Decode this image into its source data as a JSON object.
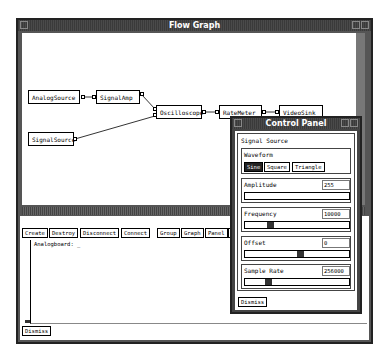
{
  "flow_window": {
    "title": "Flow Graph",
    "nodes": [
      {
        "id": "analog",
        "label": "AnalogSource"
      },
      {
        "id": "amp",
        "label": "SignalAmp"
      },
      {
        "id": "sigsrc",
        "label": "SignalSource"
      },
      {
        "id": "scope",
        "label": "Oscilloscope"
      },
      {
        "id": "rate",
        "label": "RateMeter"
      },
      {
        "id": "video",
        "label": "VideoSink"
      }
    ],
    "toolbar": [
      "Create",
      "Destroy",
      "Disconnect",
      "Connect",
      "Group",
      "Graph",
      "Panel",
      "C"
    ],
    "console_text": "Analogboard: _",
    "dismiss_label": "Dismiss"
  },
  "control_panel": {
    "title": "Control Panel",
    "section": "Signal Source",
    "waveform": {
      "label": "Waveform",
      "options": [
        "Sine",
        "Square",
        "Triangle"
      ],
      "selected": "Sine"
    },
    "params": [
      {
        "label": "Amplitude",
        "value": "255"
      },
      {
        "label": "Frequency",
        "value": "10000"
      },
      {
        "label": "Offset",
        "value": "0"
      },
      {
        "label": "Sample Rate",
        "value": "256000"
      }
    ],
    "dismiss_label": "Dismiss"
  }
}
